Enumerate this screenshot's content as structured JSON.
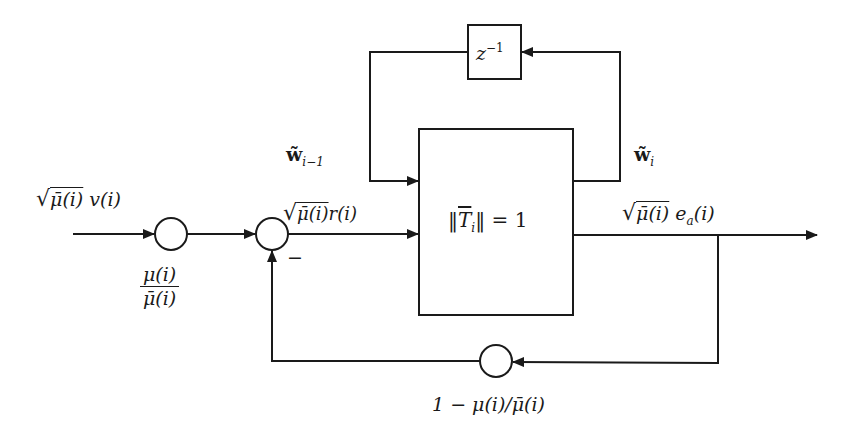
{
  "diagram": {
    "type": "block-diagram",
    "colors": {
      "stroke": "#1a1a1a",
      "background": "#ffffff"
    },
    "blocks": {
      "main": {
        "label": "‖T̄ᵢ‖ = 1",
        "norm_symbol": "T",
        "norm_subscript": "i",
        "equals": "= 1"
      },
      "delay": {
        "label": "z⁻¹",
        "base": "z",
        "exponent": "−1"
      }
    },
    "nodes": {
      "input_gain": {
        "label": "μ(i)/μ̄(i)",
        "numerator": "μ(i)",
        "denominator": "μ̄(i)"
      },
      "summer": {
        "sign": "−"
      },
      "feedback_gain": {
        "label": "1 − μ(i)/μ̄(i)"
      }
    },
    "signals": {
      "input": {
        "label": "√μ̄(i) v(i)",
        "radicand": "μ̄(i)",
        "rest": "v(i)"
      },
      "error": {
        "label": "√μ̄(i) r(i)",
        "radicand": "μ̄(i)",
        "rest": "r(i)"
      },
      "output": {
        "label": "√μ̄(i) eₐ(i)",
        "radicand": "μ̄(i)",
        "e": "e",
        "e_sub": "a",
        "rest": "(i)"
      },
      "weight_prev": {
        "label": "w̃ᵢ₋₁",
        "base": "w̃",
        "sub": "i−1"
      },
      "weight_curr": {
        "label": "w̃ᵢ",
        "base": "w̃",
        "sub": "i"
      }
    }
  }
}
